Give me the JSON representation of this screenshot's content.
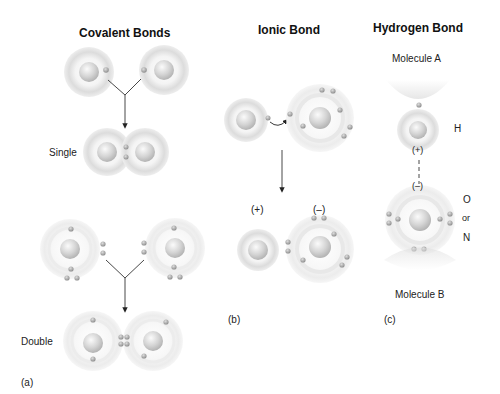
{
  "panels": {
    "covalent": {
      "title": "Covalent Bonds",
      "single_label": "Single",
      "double_label": "Double",
      "panel_letter": "(a)"
    },
    "ionic": {
      "title": "Ionic Bond",
      "positive_label": "(+)",
      "negative_label": "(–)",
      "panel_letter": "(b)"
    },
    "hydrogen": {
      "title": "Hydrogen Bond",
      "molecule_a": "Molecule A",
      "molecule_b": "Molecule B",
      "h_label": "H",
      "o_label": "O",
      "or_label": "or",
      "n_label": "N",
      "partial_positive": "(+)",
      "partial_negative": "(–)",
      "panel_letter": "(c)"
    }
  },
  "colors": {
    "background": "#ffffff",
    "atom_shell": "#e2e2e2",
    "atom_nucleus": "#c8c8c8",
    "electron": "#a8a8a8",
    "arrow": "#333333",
    "text": "#111111"
  }
}
